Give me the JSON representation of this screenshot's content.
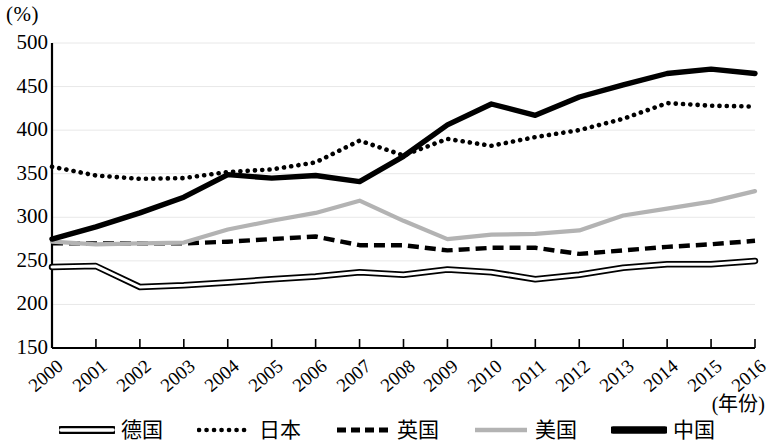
{
  "axis": {
    "y_unit_label": "(%)",
    "x_title": "(年份)",
    "y_ticks": [
      "500",
      "450",
      "400",
      "350",
      "300",
      "250",
      "200",
      "150"
    ],
    "x_ticks": [
      "2000",
      "2001",
      "2002",
      "2003",
      "2004",
      "2005",
      "2006",
      "2007",
      "2008",
      "2009",
      "2010",
      "2011",
      "2012",
      "2013",
      "2014",
      "2015",
      "2016"
    ]
  },
  "legend": {
    "items": [
      {
        "label": "德国",
        "style": "double-line",
        "color": "#000000"
      },
      {
        "label": "日本",
        "style": "dotted",
        "color": "#000000"
      },
      {
        "label": "英国",
        "style": "dashed",
        "color": "#000000"
      },
      {
        "label": "美国",
        "style": "solid-gray",
        "color": "#b3b3b3"
      },
      {
        "label": "中国",
        "style": "solid-thick",
        "color": "#000000"
      }
    ]
  },
  "chart_data": {
    "type": "line",
    "title": "",
    "subtitle": "",
    "xlabel": "(年份)",
    "ylabel": "(%)",
    "ylim": [
      150,
      500
    ],
    "ytick_step": 50,
    "grid": true,
    "legend_position": "bottom",
    "x": [
      "2000",
      "2001",
      "2002",
      "2003",
      "2004",
      "2005",
      "2006",
      "2007",
      "2008",
      "2009",
      "2010",
      "2011",
      "2012",
      "2013",
      "2014",
      "2015",
      "2016"
    ],
    "categories": [
      "2000",
      "2001",
      "2002",
      "2003",
      "2004",
      "2005",
      "2006",
      "2007",
      "2008",
      "2009",
      "2010",
      "2011",
      "2012",
      "2013",
      "2014",
      "2015",
      "2016"
    ],
    "series": [
      {
        "name": "德国",
        "style": "double-line",
        "color": "#000000",
        "values": [
          243,
          244,
          220,
          222,
          225,
          229,
          232,
          237,
          234,
          240,
          237,
          229,
          234,
          242,
          246,
          246,
          250
        ]
      },
      {
        "name": "日本",
        "style": "dotted",
        "color": "#000000",
        "values": [
          358,
          348,
          344,
          345,
          352,
          355,
          363,
          388,
          371,
          390,
          382,
          392,
          400,
          413,
          431,
          428,
          427
        ]
      },
      {
        "name": "英国",
        "style": "dashed",
        "color": "#000000",
        "values": [
          270,
          270,
          270,
          270,
          272,
          275,
          278,
          268,
          268,
          262,
          265,
          265,
          258,
          262,
          266,
          269,
          273
        ]
      },
      {
        "name": "美国",
        "style": "solid-gray",
        "color": "#b3b3b3",
        "values": [
          272,
          269,
          270,
          271,
          286,
          296,
          305,
          319,
          296,
          275,
          280,
          281,
          285,
          302,
          310,
          318,
          330
        ]
      },
      {
        "name": "中国",
        "style": "solid-thick",
        "color": "#000000",
        "values": [
          275,
          289,
          305,
          323,
          349,
          345,
          348,
          341,
          370,
          406,
          430,
          417,
          438,
          452,
          465,
          470,
          465
        ]
      }
    ]
  }
}
